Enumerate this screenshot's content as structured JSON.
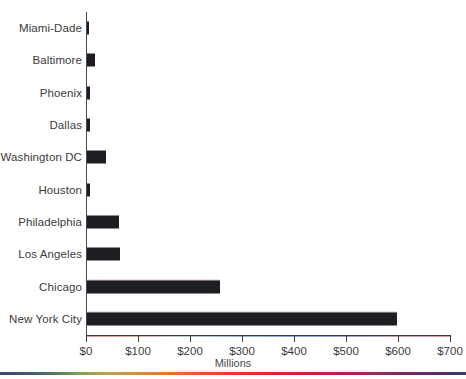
{
  "chart_data": {
    "type": "bar",
    "orientation": "horizontal",
    "title": "",
    "xlabel": "Millions",
    "ylabel": "",
    "xlim": [
      0,
      700
    ],
    "ylim": [
      0,
      10
    ],
    "grid": false,
    "legend": null,
    "bar_color": "#1d1d22",
    "axis_color": "#3a3a3a",
    "tick_labels_x": [
      "$0",
      "$100",
      "$200",
      "$300",
      "$400",
      "$500",
      "$600",
      "$700"
    ],
    "tick_values_x": [
      0,
      100,
      200,
      300,
      400,
      500,
      600,
      700
    ],
    "categories": [
      "Miami-Dade",
      "Baltimore",
      "Phoenix",
      "Dallas",
      "Washington DC",
      "Houston",
      "Philadelphia",
      "Los Angeles",
      "Chicago",
      "New York City"
    ],
    "values": [
      4,
      15,
      6,
      6,
      37,
      6,
      62,
      63,
      256,
      596
    ],
    "units": "Millions of dollars"
  },
  "decoration": {
    "title_sliver_text": "",
    "spectrum_strip_name": "spectrum-gradient-strip"
  }
}
